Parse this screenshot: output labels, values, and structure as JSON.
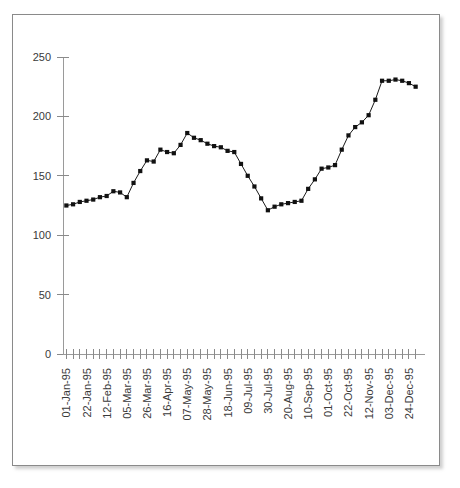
{
  "figure": {
    "border_color": "#8a8a8a",
    "background": "#ffffff"
  },
  "chart_data": {
    "type": "line",
    "title": "",
    "subtitle": "",
    "xlabel": "",
    "ylabel": "",
    "grid": false,
    "legend": "none",
    "marker": "filled-square",
    "line_color": "#1a1a1a",
    "marker_color": "#111111",
    "ylim": [
      0,
      250
    ],
    "yticks": [
      0,
      50,
      100,
      150,
      200,
      250
    ],
    "ytick_labels": [
      "0",
      "50",
      "100",
      "150",
      "200",
      "250"
    ],
    "xtick_label_rotation": -90,
    "xtick_label_every": 3,
    "xtick_labels": [
      "01-Jan-95",
      "22-Jan-95",
      "12-Feb-95",
      "05-Mar-95",
      "26-Mar-95",
      "16-Apr-95",
      "07-May-95",
      "28-May-95",
      "18-Jun-95",
      "09-Jul-95",
      "30-Jul-95",
      "20-Aug-95",
      "10-Sep-95",
      "01-Oct-95",
      "22-Oct-95",
      "12-Nov-95",
      "03-Dec-95",
      "24-Dec-95"
    ],
    "x": [
      "01-Jan-95",
      "08-Jan-95",
      "15-Jan-95",
      "22-Jan-95",
      "29-Jan-95",
      "05-Feb-95",
      "12-Feb-95",
      "19-Feb-95",
      "26-Feb-95",
      "05-Mar-95",
      "12-Mar-95",
      "19-Mar-95",
      "26-Mar-95",
      "02-Apr-95",
      "09-Apr-95",
      "16-Apr-95",
      "23-Apr-95",
      "30-Apr-95",
      "07-May-95",
      "14-May-95",
      "21-May-95",
      "28-May-95",
      "04-Jun-95",
      "11-Jun-95",
      "18-Jun-95",
      "25-Jun-95",
      "02-Jul-95",
      "09-Jul-95",
      "16-Jul-95",
      "23-Jul-95",
      "30-Jul-95",
      "06-Aug-95",
      "13-Aug-95",
      "20-Aug-95",
      "27-Aug-95",
      "03-Sep-95",
      "10-Sep-95",
      "17-Sep-95",
      "24-Sep-95",
      "01-Oct-95",
      "08-Oct-95",
      "15-Oct-95",
      "22-Oct-95",
      "29-Oct-95",
      "05-Nov-95",
      "12-Nov-95",
      "19-Nov-95",
      "26-Nov-95",
      "03-Dec-95",
      "10-Dec-95",
      "17-Dec-95",
      "24-Dec-95",
      "31-Dec-95"
    ],
    "values": [
      125,
      126,
      128,
      129,
      130,
      132,
      133,
      137,
      136,
      132,
      144,
      154,
      163,
      162,
      172,
      170,
      169,
      176,
      186,
      182,
      180,
      177,
      175,
      174,
      171,
      170,
      160,
      150,
      141,
      131,
      121,
      124,
      126,
      127,
      128,
      129,
      139,
      147,
      156,
      157,
      159,
      172,
      184,
      191,
      195,
      201,
      214,
      230,
      230,
      231,
      230,
      228,
      225
    ]
  }
}
